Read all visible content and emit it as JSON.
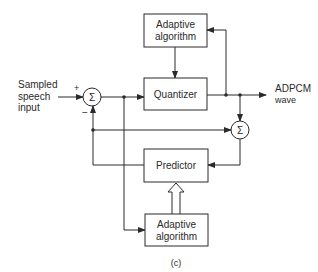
{
  "diagram": {
    "type": "block-diagram",
    "caption": "(c)",
    "input": {
      "lines": [
        "Sampled",
        "speech",
        "input"
      ]
    },
    "output": {
      "lines": [
        "ADPCM",
        "wave"
      ]
    },
    "sum_symbol": "Σ",
    "signs": {
      "plus": "+",
      "minus": "−"
    },
    "blocks": {
      "adaptive_top": {
        "lines": [
          "Adaptive",
          "algorithm"
        ]
      },
      "quantizer": {
        "label": "Quantizer"
      },
      "predictor": {
        "label": "Predictor"
      },
      "adaptive_bottom": {
        "lines": [
          "Adaptive",
          "algorithm"
        ]
      }
    },
    "colors": {
      "stroke": "#2a2a2a",
      "background": "#ffffff"
    }
  }
}
